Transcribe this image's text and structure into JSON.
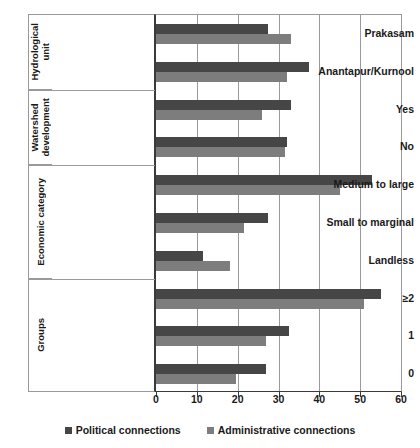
{
  "chart_data": {
    "type": "bar",
    "orientation": "horizontal",
    "title": "",
    "xlabel": "",
    "ylabel": "",
    "xlim": [
      0,
      60
    ],
    "xticks": [
      0,
      10,
      20,
      30,
      40,
      50,
      60
    ],
    "grid": true,
    "legend_position": "bottom",
    "series": [
      {
        "name": "Political connections",
        "color": "#464646",
        "values": [
          27.5,
          37.5,
          33.0,
          32.0,
          53.0,
          27.5,
          11.5,
          55.0,
          32.5,
          27.0
        ]
      },
      {
        "name": "Administrative connections",
        "color": "#7d7d7d",
        "values": [
          33.0,
          32.0,
          26.0,
          31.5,
          45.0,
          21.5,
          18.0,
          51.0,
          27.0,
          19.5
        ]
      }
    ],
    "categories": [
      "Prakasam",
      "Anantapur/Kurnool",
      "Yes",
      "No",
      "Medium to large",
      "Small to marginal",
      "Landless",
      "≥2",
      "1",
      "0"
    ],
    "groups": [
      {
        "label": "Hydrological\nunit",
        "categories": [
          "Prakasam",
          "Anantapur/Kurnool"
        ]
      },
      {
        "label": "Watershed\ndevelopment",
        "categories": [
          "Yes",
          "No"
        ]
      },
      {
        "label": "Economic category",
        "categories": [
          "Medium to large",
          "Small to marginal",
          "Landless"
        ]
      },
      {
        "label": "Groups",
        "categories": [
          "≥2",
          "1",
          "0"
        ]
      }
    ]
  },
  "legend": {
    "items": [
      {
        "label": "Political connections",
        "color": "#464646"
      },
      {
        "label": "Administrative connections",
        "color": "#7d7d7d"
      }
    ]
  },
  "axis": {
    "tick_labels": [
      "0",
      "10",
      "20",
      "30",
      "40",
      "50",
      "60"
    ]
  }
}
